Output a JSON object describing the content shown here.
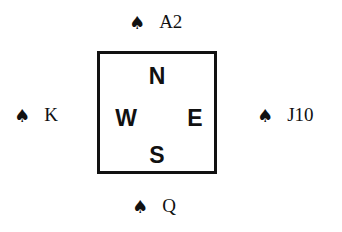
{
  "diagram": {
    "compass": {
      "north": "N",
      "west": "W",
      "east": "E",
      "south": "S"
    },
    "hands": {
      "north": {
        "suit_icon": "♠",
        "cards": "A2"
      },
      "west": {
        "suit_icon": "♠",
        "cards": "K"
      },
      "east": {
        "suit_icon": "♠",
        "cards": "J10"
      },
      "south": {
        "suit_icon": "♠",
        "cards": "Q"
      }
    }
  }
}
